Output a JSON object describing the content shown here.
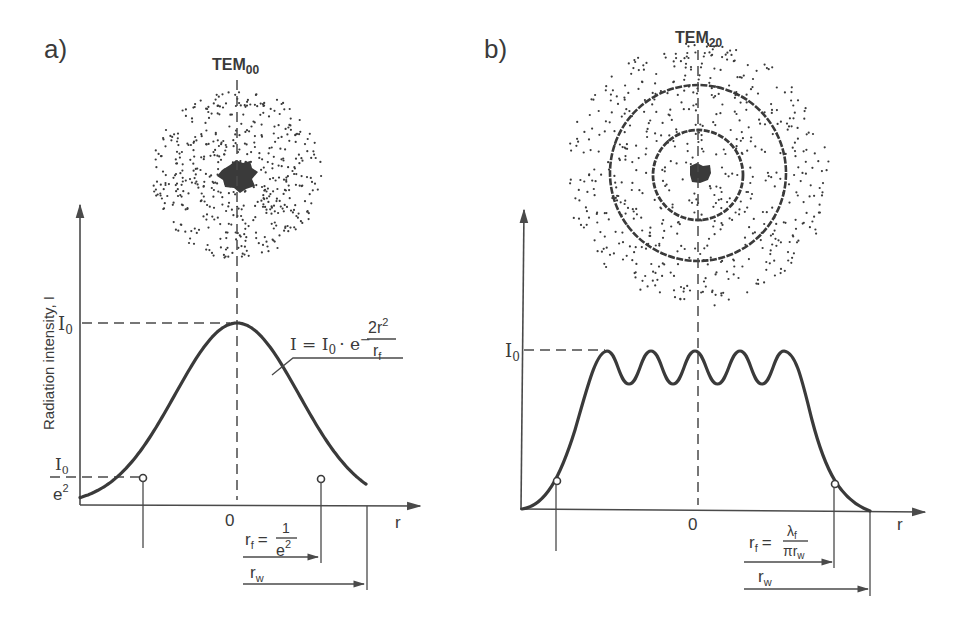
{
  "panel_a": {
    "label": "a)",
    "mode": "TEM",
    "mode_sub": "00",
    "y_axis_label": "Radiation intensity, I",
    "x_axis_label": "r",
    "origin": "0",
    "i0": "I",
    "i0_sub": "0",
    "i0e2_num": "I",
    "i0e2_num_sub": "0",
    "i0e2_den": "e",
    "i0e2_den_sup": "2",
    "formula_lhs": "I = I",
    "formula_lhs_sub": "0",
    "formula_mid": "· e",
    "formula_minus": "−",
    "formula_num": "2r",
    "formula_num_sup": "2",
    "formula_den": "r",
    "formula_den_sub": "f",
    "rf_lhs": "r",
    "rf_lhs_sub": "f",
    "rf_eq": "=",
    "rf_num": "1",
    "rf_den": "e",
    "rf_den_sup": "2",
    "rw": "r",
    "rw_sub": "w"
  },
  "panel_b": {
    "label": "b)",
    "mode": "TEM",
    "mode_sub": "20",
    "x_axis_label": "r",
    "origin": "0",
    "i0": "I",
    "i0_sub": "0",
    "rf_lhs": "r",
    "rf_lhs_sub": "f",
    "rf_eq": "=",
    "rf_num": "λ",
    "rf_num_sub": "f",
    "rf_den": "πr",
    "rf_den_sub": "w",
    "rw": "r",
    "rw_sub": "w"
  },
  "colors": {
    "ink": "#3a3a3a",
    "background": "#ffffff"
  }
}
